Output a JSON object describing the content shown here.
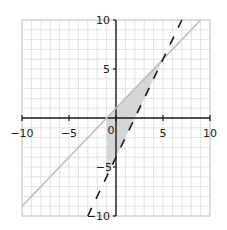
{
  "chart_data": {
    "type": "line",
    "title": "",
    "xlabel": "",
    "ylabel": "",
    "xlim": [
      -10,
      10
    ],
    "ylim": [
      -10,
      10
    ],
    "grid": true,
    "grid_step": 1,
    "x_ticks": [
      -10,
      -5,
      0,
      5,
      10
    ],
    "y_ticks": [
      -10,
      -5,
      5,
      10
    ],
    "x_tick_labels": [
      "−10",
      "−5",
      "0",
      "5",
      "10"
    ],
    "y_tick_labels": [
      "−10",
      "−5",
      "5",
      "10"
    ],
    "series": [
      {
        "name": "y = x + 1",
        "style": "solid",
        "color": "#b8b8b8",
        "equation": "y = x + 1",
        "points": [
          [
            -10,
            -9
          ],
          [
            9,
            10
          ]
        ]
      },
      {
        "name": "y = 2x − 4",
        "style": "dashed",
        "color": "#222222",
        "equation": "y = 2x - 4",
        "points": [
          [
            -3,
            -10
          ],
          [
            7,
            10
          ]
        ]
      }
    ],
    "shaded_region": {
      "description": "x ≥ −1, y ≤ x + 1, y ≥ 2x − 4",
      "color": "#cccccc",
      "vertices": [
        [
          -1,
          0
        ],
        [
          5,
          6
        ],
        [
          -1,
          -6
        ]
      ]
    }
  },
  "labels": {
    "x_ticks": [
      "−10",
      "−5",
      "0",
      "5",
      "10"
    ],
    "y_ticks": [
      "10",
      "5",
      "−5",
      "−10"
    ]
  }
}
